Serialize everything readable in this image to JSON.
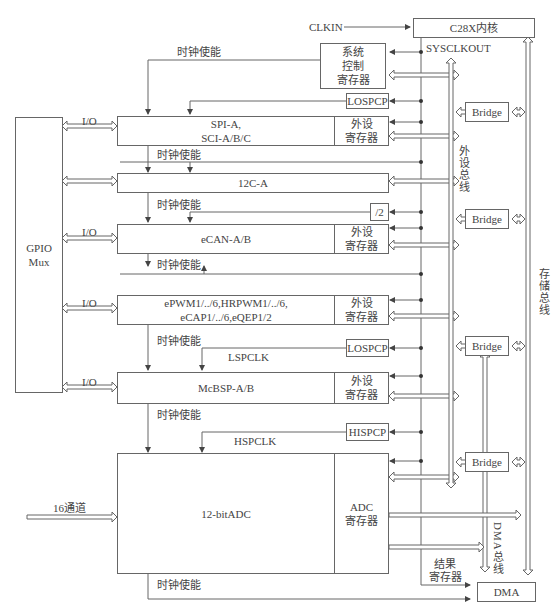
{
  "core": {
    "label": "C28X内核",
    "clkin": "CLKIN",
    "sysclkout": "SYSCLKOUT"
  },
  "sys_ctrl": {
    "label_lines": [
      "系统",
      "控制",
      "寄存器"
    ]
  },
  "gpio": {
    "label_lines": [
      "GPIO",
      "Mux"
    ]
  },
  "io_label": "I/O",
  "clock_enable": "时钟使能",
  "periph_reg": [
    "外设",
    "寄存器"
  ],
  "modules": [
    {
      "id": "spi",
      "lines": [
        "SPI-A,",
        "SCI-A/B/C"
      ]
    },
    {
      "id": "i2c",
      "lines": [
        "12C-A"
      ]
    },
    {
      "id": "ecan",
      "lines": [
        "eCAN-A/B"
      ]
    },
    {
      "id": "epwm",
      "lines": [
        "ePWM1/../6,HRPWM1/../6,",
        "eCAP1/../6,eQEP1/2"
      ]
    },
    {
      "id": "mcbsp",
      "lines": [
        "McBSP-A/B"
      ]
    },
    {
      "id": "adc",
      "lines": [
        "12-bitADC"
      ]
    }
  ],
  "prescalers": {
    "lospcp1": "LOSPCP",
    "div2": "/2",
    "lospcp2": "LOSPCP",
    "hispcp": "HISPCP"
  },
  "clocks": {
    "lspclk": "LSPCLK",
    "hspclk": "HSPCLK"
  },
  "adc": {
    "input": "16通道",
    "reg_lines": [
      "ADC",
      "寄存器"
    ],
    "result_lines": [
      "结果",
      "寄存器"
    ]
  },
  "bridge": "Bridge",
  "buses": {
    "peripheral": "外设总线",
    "memory": "存储总线",
    "dma": "DMA总线"
  },
  "dma": {
    "label": "DMA"
  }
}
